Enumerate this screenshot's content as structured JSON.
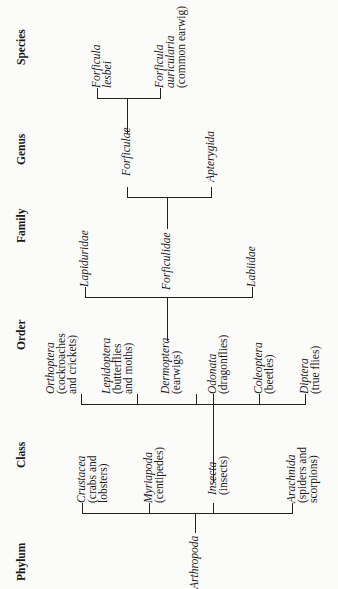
{
  "headers": {
    "phylum": "Phylum",
    "class": "Class",
    "order": "Order",
    "family": "Family",
    "genus": "Genus",
    "species": "Species"
  },
  "phylum": {
    "name": "Arthropoda"
  },
  "classes": [
    {
      "name": "Crustacea",
      "common1": "(crabs and",
      "common2": "lobsters)"
    },
    {
      "name": "Myriapoda",
      "common1": "(centipedes)",
      "common2": ""
    },
    {
      "name": "Insecta",
      "common1": "(insects)",
      "common2": ""
    },
    {
      "name": "Arachnida",
      "common1": "(spiders and",
      "common2": "scorpions)"
    }
  ],
  "orders": [
    {
      "name": "Orthoptera",
      "common1": "(cockroaches",
      "common2": "and crickets)"
    },
    {
      "name": "Lepidoptera",
      "common1": "(butterflies",
      "common2": "and moths)"
    },
    {
      "name": "Dermoptera",
      "common1": "(earwigs)",
      "common2": ""
    },
    {
      "name": "Odonata",
      "common1": "(dragonflies)",
      "common2": ""
    },
    {
      "name": "Coleoptera",
      "common1": "(beetles)",
      "common2": ""
    },
    {
      "name": "Diptera",
      "common1": "(true flies)",
      "common2": ""
    }
  ],
  "families": [
    {
      "name": "Lapiduridae"
    },
    {
      "name": "Forficulidae"
    },
    {
      "name": "Labiidae"
    }
  ],
  "genera": [
    {
      "name": "Forficulae"
    },
    {
      "name": "Apterygida"
    }
  ],
  "species": [
    {
      "name1": "Forficula",
      "name2": "lesbei",
      "common": ""
    },
    {
      "name1": "Forficula",
      "name2": "auricularia",
      "common": "(common earwig)"
    }
  ]
}
